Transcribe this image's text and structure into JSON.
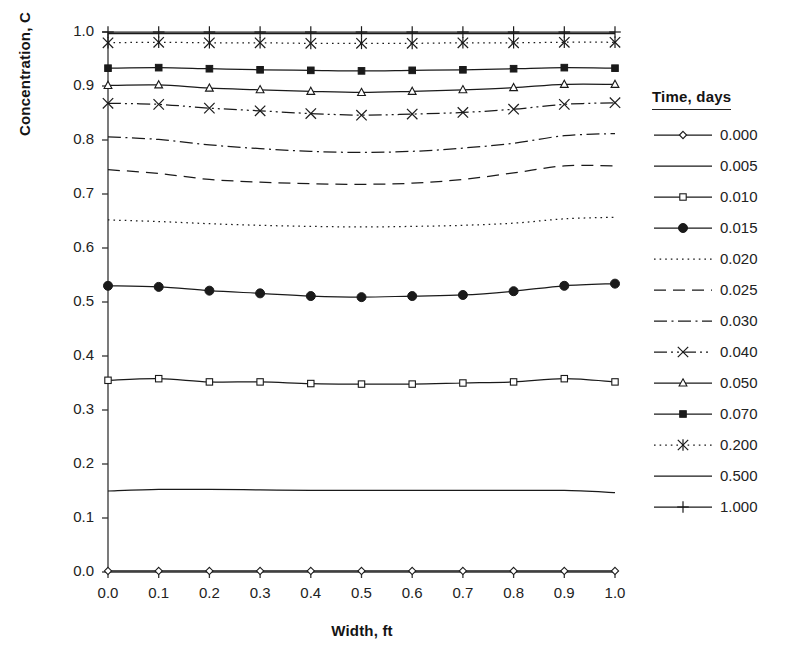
{
  "chart_data": {
    "type": "line",
    "title": "",
    "xlabel": "Width, ft",
    "ylabel": "Concentration, C",
    "xlim": [
      0.0,
      1.0
    ],
    "ylim": [
      0.0,
      1.0
    ],
    "grid": false,
    "legend_position": "right",
    "legend_title": "Time, days",
    "x": [
      0.0,
      0.1,
      0.2,
      0.3,
      0.4,
      0.5,
      0.6,
      0.7,
      0.8,
      0.9,
      1.0
    ],
    "xticks": [
      "0.0",
      "0.1",
      "0.2",
      "0.3",
      "0.4",
      "0.5",
      "0.6",
      "0.7",
      "0.8",
      "0.9",
      "1.0"
    ],
    "yticks": [
      "0.0",
      "0.1",
      "0.2",
      "0.3",
      "0.4",
      "0.5",
      "0.6",
      "0.7",
      "0.8",
      "0.9",
      "1.0"
    ],
    "series": [
      {
        "name": "0.000",
        "marker": "open-diamond",
        "linestyle": "solid",
        "values": [
          0.002,
          0.002,
          0.002,
          0.002,
          0.002,
          0.002,
          0.002,
          0.002,
          0.002,
          0.002,
          0.002
        ]
      },
      {
        "name": "0.005",
        "marker": "none",
        "linestyle": "solid",
        "values": [
          0.15,
          0.153,
          0.153,
          0.152,
          0.151,
          0.151,
          0.151,
          0.151,
          0.151,
          0.151,
          0.147
        ]
      },
      {
        "name": "0.010",
        "marker": "open-square",
        "linestyle": "solid",
        "values": [
          0.355,
          0.358,
          0.352,
          0.352,
          0.349,
          0.348,
          0.348,
          0.35,
          0.352,
          0.358,
          0.352
        ]
      },
      {
        "name": "0.015",
        "marker": "filled-circle",
        "linestyle": "solid",
        "values": [
          0.53,
          0.528,
          0.521,
          0.516,
          0.511,
          0.509,
          0.511,
          0.513,
          0.52,
          0.53,
          0.534
        ]
      },
      {
        "name": "0.020",
        "marker": "none",
        "linestyle": "dotted",
        "values": [
          0.652,
          0.649,
          0.645,
          0.642,
          0.64,
          0.639,
          0.64,
          0.642,
          0.646,
          0.654,
          0.657
        ]
      },
      {
        "name": "0.025",
        "marker": "none",
        "linestyle": "dashed",
        "values": [
          0.745,
          0.738,
          0.727,
          0.722,
          0.719,
          0.718,
          0.72,
          0.727,
          0.739,
          0.752,
          0.752
        ]
      },
      {
        "name": "0.030",
        "marker": "none",
        "linestyle": "dashdot",
        "values": [
          0.806,
          0.801,
          0.791,
          0.784,
          0.779,
          0.777,
          0.779,
          0.785,
          0.794,
          0.808,
          0.812
        ]
      },
      {
        "name": "0.040",
        "marker": "x-cross",
        "linestyle": "dashdotdot",
        "values": [
          0.868,
          0.866,
          0.859,
          0.854,
          0.849,
          0.846,
          0.848,
          0.851,
          0.857,
          0.866,
          0.869
        ]
      },
      {
        "name": "0.050",
        "marker": "open-triangle",
        "linestyle": "solid",
        "values": [
          0.901,
          0.902,
          0.896,
          0.893,
          0.89,
          0.888,
          0.89,
          0.893,
          0.897,
          0.903,
          0.903
        ]
      },
      {
        "name": "0.070",
        "marker": "filled-square",
        "linestyle": "solid",
        "values": [
          0.933,
          0.934,
          0.932,
          0.93,
          0.929,
          0.928,
          0.929,
          0.93,
          0.932,
          0.934,
          0.933
        ]
      },
      {
        "name": "0.200",
        "marker": "asterisk",
        "linestyle": "dotted",
        "values": [
          0.98,
          0.981,
          0.98,
          0.98,
          0.979,
          0.979,
          0.979,
          0.98,
          0.98,
          0.981,
          0.981
        ]
      },
      {
        "name": "0.500",
        "marker": "none",
        "linestyle": "solid",
        "values": [
          0.997,
          0.997,
          0.997,
          0.997,
          0.997,
          0.997,
          0.997,
          0.997,
          0.997,
          0.997,
          0.997
        ]
      },
      {
        "name": "1.000",
        "marker": "plus",
        "linestyle": "solid",
        "values": [
          1.0,
          1.0,
          1.0,
          1.0,
          1.0,
          1.0,
          1.0,
          1.0,
          1.0,
          1.0,
          1.0
        ]
      }
    ]
  },
  "colors": {
    "line": "#1a1a1a",
    "axis": "#333333",
    "text": "#222222",
    "background": "#ffffff"
  }
}
